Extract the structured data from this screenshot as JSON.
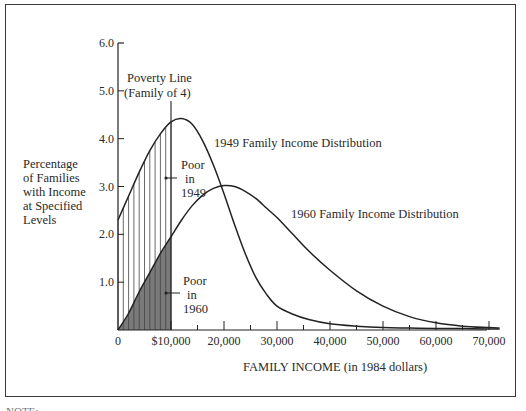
{
  "chart_data": {
    "type": "line",
    "title": "",
    "xlabel": "FAMILY INCOME (in 1984 dollars)",
    "ylabel": [
      "Percentage",
      "of Families",
      "with Income",
      "at Specified",
      "Levels"
    ],
    "xlim": [
      0,
      72000
    ],
    "ylim": [
      0,
      6.0
    ],
    "x_ticks": [
      {
        "value": 0,
        "label": "0"
      },
      {
        "value": 10000,
        "label": "$10,000"
      },
      {
        "value": 20000,
        "label": "20,000"
      },
      {
        "value": 30000,
        "label": "30,000"
      },
      {
        "value": 40000,
        "label": "40,000"
      },
      {
        "value": 50000,
        "label": "50,000"
      },
      {
        "value": 60000,
        "label": "60,000"
      },
      {
        "value": 70000,
        "label": "70,000"
      }
    ],
    "x_minor_ticks": [
      15000,
      25000,
      35000,
      45000,
      55000,
      65000
    ],
    "y_ticks": [
      {
        "value": 1.0,
        "label": "1.0"
      },
      {
        "value": 2.0,
        "label": "2.0"
      },
      {
        "value": 3.0,
        "label": "3.0"
      },
      {
        "value": 4.0,
        "label": "4.0"
      },
      {
        "value": 5.0,
        "label": "5.0"
      },
      {
        "value": 6.0,
        "label": "6.0"
      }
    ],
    "grid": false,
    "legend": "none (direct curve labels)",
    "series": [
      {
        "name": "1949 Family Income Distribution",
        "x": [
          0,
          2000,
          4000,
          6000,
          8000,
          10000,
          12000,
          14000,
          16000,
          18000,
          20000,
          22000,
          24000,
          26000,
          28000,
          30000,
          33000,
          36000,
          40000,
          45000,
          50000,
          55000,
          60000,
          65000,
          70000,
          72000
        ],
        "y": [
          2.3,
          2.8,
          3.3,
          3.75,
          4.1,
          4.35,
          4.42,
          4.3,
          3.95,
          3.45,
          2.85,
          2.2,
          1.6,
          1.1,
          0.75,
          0.5,
          0.33,
          0.22,
          0.13,
          0.08,
          0.05,
          0.04,
          0.03,
          0.03,
          0.02,
          0.02
        ]
      },
      {
        "name": "1960 Family Income Distribution",
        "x": [
          0,
          2000,
          4000,
          6000,
          8000,
          10000,
          12000,
          14000,
          16000,
          18000,
          20000,
          22000,
          24000,
          26000,
          28000,
          30000,
          33000,
          36000,
          40000,
          45000,
          50000,
          55000,
          60000,
          65000,
          70000,
          72000
        ],
        "y": [
          0.0,
          0.35,
          0.8,
          1.2,
          1.6,
          1.95,
          2.3,
          2.6,
          2.82,
          2.96,
          3.02,
          3.0,
          2.9,
          2.75,
          2.55,
          2.35,
          2.0,
          1.65,
          1.25,
          0.82,
          0.5,
          0.28,
          0.15,
          0.08,
          0.05,
          0.04
        ]
      }
    ],
    "annotations": [
      {
        "text": [
          "Poverty Line",
          "(Family of 4)"
        ],
        "x": 10000,
        "note": "vertical line at $10,000"
      },
      {
        "text": [
          "Poor",
          "in",
          "1949"
        ],
        "region": "vertically hatched area under 1949 curve, 0–$10,000"
      },
      {
        "text": [
          "Poor",
          "in",
          "1960"
        ],
        "region": "gray shaded area under 1960 curve, 0–$10,000"
      },
      {
        "text": "1949 Family Income Distribution",
        "target": "1949 curve"
      },
      {
        "text": "1960 Family Income Distribution",
        "target": "1960 curve"
      }
    ],
    "poverty_line_x": 10000,
    "colors": {
      "line": "#222222",
      "shade_1960": "#7a7a7a",
      "hatch_1949": "#444444"
    }
  },
  "labels": {
    "poverty_line_1": "Poverty Line",
    "poverty_line_2": "(Family of 4)",
    "poor_1949": [
      "Poor",
      "in",
      "1949"
    ],
    "poor_1960": [
      "Poor",
      "in",
      "1960"
    ],
    "curve_1949": "1949 Family Income Distribution",
    "curve_1960": "1960 Family Income Distribution"
  },
  "note_text": "NOTE: ..."
}
